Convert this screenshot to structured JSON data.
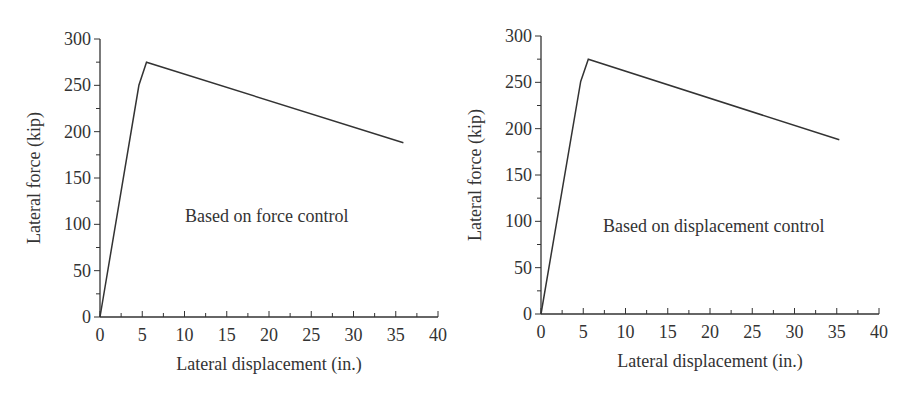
{
  "chart_data": [
    {
      "type": "line",
      "title": "",
      "annotation": "Based on force control",
      "xlabel": "Lateral displacement (in.)",
      "ylabel": "Lateral force (kip)",
      "xlim": [
        0,
        40
      ],
      "ylim": [
        0,
        300
      ],
      "xticks": [
        0,
        5,
        10,
        15,
        20,
        25,
        30,
        35,
        40
      ],
      "yticks": [
        0,
        50,
        100,
        150,
        200,
        250,
        300
      ],
      "grid": false,
      "legend": null,
      "series": [
        {
          "name": "Pushover curve (force control)",
          "x": [
            0,
            4.6,
            5.5,
            35.9
          ],
          "y": [
            0,
            250,
            275,
            188
          ]
        }
      ]
    },
    {
      "type": "line",
      "title": "",
      "annotation": "Based on displacement control",
      "xlabel": "Lateral displacement (in.)",
      "ylabel": "Lateral force (kip)",
      "xlim": [
        0,
        40
      ],
      "ylim": [
        0,
        300
      ],
      "xticks": [
        0,
        5,
        10,
        15,
        20,
        25,
        30,
        35,
        40
      ],
      "yticks": [
        0,
        50,
        100,
        150,
        200,
        250,
        300
      ],
      "grid": false,
      "legend": null,
      "series": [
        {
          "name": "Pushover curve (displacement control)",
          "x": [
            0,
            4.7,
            5.6,
            35.3
          ],
          "y": [
            0,
            251,
            275,
            188
          ]
        }
      ]
    }
  ],
  "colors": {
    "line": "#333333",
    "axis": "#333333",
    "text": "#333333"
  }
}
